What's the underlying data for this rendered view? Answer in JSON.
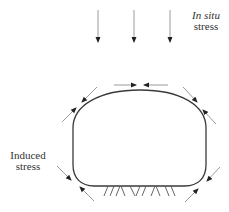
{
  "diagram": {
    "labels": {
      "in_situ_line1": "In situ",
      "in_situ_line2": "stress",
      "induced_line1": "Induced",
      "induced_line2": "stress"
    },
    "colors": {
      "outline": "#3a3a3a",
      "arrow_line": "#9a9a9a",
      "arrow_head": "#222222",
      "text": "#333333",
      "background": "#ffffff"
    },
    "elements": {
      "in_situ_arrows": 3,
      "induced_arrow_pairs": 5,
      "shape": "tunnel-opening-cross-section",
      "floor": "hatched-ground"
    }
  }
}
